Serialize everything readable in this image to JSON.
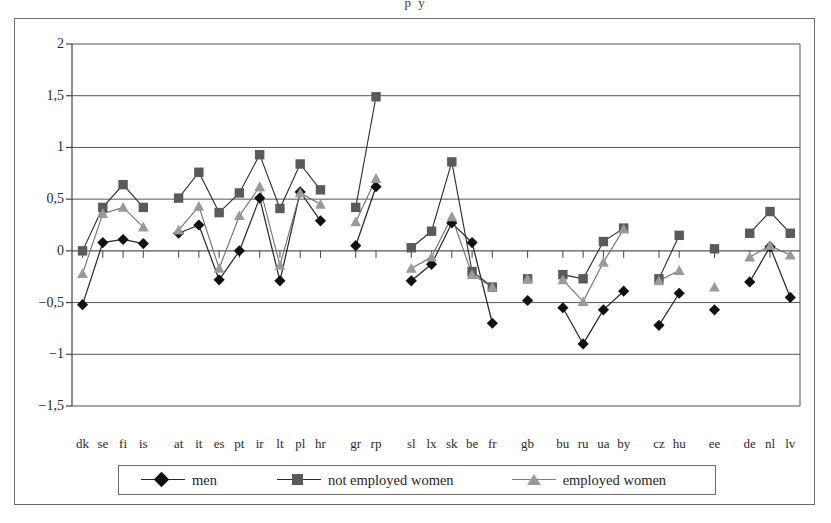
{
  "figure": {
    "title_fragment": "p y"
  },
  "legend": {
    "position": "bottom",
    "entries": [
      {
        "label": "men",
        "marker": "diamond",
        "color": "#111111",
        "line_color": "#2b2b2b"
      },
      {
        "label": "not employed women",
        "marker": "square",
        "color": "#5a5a5a",
        "line_color": "#2b2b2b"
      },
      {
        "label": "employed women",
        "marker": "triangle",
        "color": "#9a9a9a",
        "line_color": "#7d7d7d"
      }
    ]
  },
  "chart_data": {
    "type": "line",
    "title": "",
    "subtitle": "",
    "xlabel": "",
    "ylabel": "",
    "ylim": [
      -1.5,
      2
    ],
    "yticks": [
      2,
      1.5,
      1,
      0.5,
      0,
      -0.5,
      -1,
      -1.5
    ],
    "ytick_labels": [
      "2",
      "1,5",
      "1",
      "0,5",
      "0",
      "−0,5",
      "−1",
      "−1,5"
    ],
    "decimal_separator": ",",
    "grid": true,
    "grid_axis": "y",
    "legend_position": "bottom",
    "categories": [
      "dk",
      "se",
      "fi",
      "is",
      "at",
      "it",
      "es",
      "pt",
      "ir",
      "lt",
      "pl",
      "hr",
      "gr",
      "rp",
      "sl",
      "lx",
      "sk",
      "be",
      "fr",
      "gb",
      "bu",
      "ru",
      "ua",
      "by",
      "cz",
      "hu",
      "ee",
      "de",
      "nl",
      "lv"
    ],
    "groups": [
      {
        "name": "nordic",
        "categories": [
          "dk",
          "se",
          "fi",
          "is"
        ]
      },
      {
        "name": "western-southern",
        "categories": [
          "at",
          "it",
          "es",
          "pt",
          "ir",
          "lt",
          "pl",
          "hr"
        ]
      },
      {
        "name": "gr-rp",
        "categories": [
          "gr",
          "rp"
        ]
      },
      {
        "name": "central",
        "categories": [
          "sl",
          "lx",
          "sk",
          "be",
          "fr"
        ]
      },
      {
        "name": "gb",
        "categories": [
          "gb"
        ]
      },
      {
        "name": "eastern",
        "categories": [
          "bu",
          "ru",
          "ua",
          "by"
        ]
      },
      {
        "name": "cz-hu",
        "categories": [
          "cz",
          "hu"
        ]
      },
      {
        "name": "ee",
        "categories": [
          "ee"
        ]
      },
      {
        "name": "baltic-de",
        "categories": [
          "de",
          "nl",
          "lv"
        ]
      }
    ],
    "series": [
      {
        "name": "men",
        "marker": "diamond",
        "color": "#111111",
        "values": [
          -0.52,
          0.08,
          0.11,
          0.07,
          0.17,
          0.25,
          -0.28,
          0.0,
          0.51,
          -0.29,
          0.57,
          0.29,
          0.05,
          0.62,
          -0.29,
          -0.13,
          0.27,
          0.08,
          -0.7,
          -0.48,
          -0.55,
          -0.9,
          -0.57,
          -0.39,
          -0.72,
          -0.41,
          -0.57,
          -0.3,
          0.04,
          -0.45
        ]
      },
      {
        "name": "not employed women",
        "marker": "square",
        "color": "#5a5a5a",
        "values": [
          0.0,
          0.42,
          0.64,
          0.42,
          0.51,
          0.76,
          0.37,
          0.56,
          0.93,
          0.41,
          0.84,
          0.59,
          0.42,
          1.49,
          0.03,
          0.19,
          0.86,
          -0.2,
          -0.35,
          -0.27,
          -0.23,
          -0.27,
          0.09,
          0.22,
          -0.27,
          0.15,
          0.02,
          0.17,
          0.38,
          0.17
        ]
      },
      {
        "name": "employed women",
        "marker": "triangle",
        "color": "#9a9a9a",
        "values": [
          -0.22,
          0.36,
          0.42,
          0.23,
          0.2,
          0.43,
          -0.17,
          0.34,
          0.62,
          -0.14,
          0.56,
          0.45,
          0.28,
          0.7,
          -0.17,
          -0.06,
          0.33,
          -0.23,
          -0.35,
          -0.27,
          -0.28,
          -0.49,
          -0.11,
          0.21,
          -0.29,
          -0.19,
          -0.35,
          -0.06,
          0.05,
          -0.04
        ]
      }
    ]
  }
}
